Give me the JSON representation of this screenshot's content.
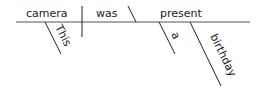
{
  "diagram": {
    "type": "sentence-diagram",
    "sentence": [
      "This",
      "camera",
      "was",
      "a",
      "birthday",
      "present"
    ],
    "subject": "camera",
    "verb": "was",
    "predicate_nominative": "present",
    "modifiers": {
      "subject": [
        "This"
      ],
      "predicate_nominative": [
        "a",
        "birthday"
      ]
    },
    "colors": {
      "line": "#222222",
      "text": "#1a1a1a",
      "background": "#ffffff"
    }
  }
}
